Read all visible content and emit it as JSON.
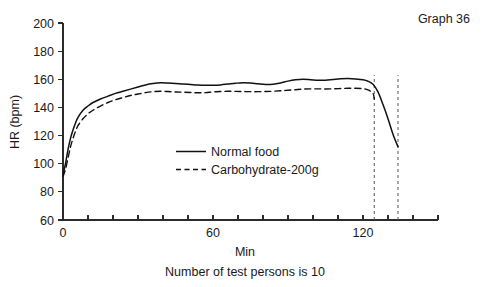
{
  "figure": {
    "graph_id": "Graph 36",
    "caption": "Number of test persons is 10"
  },
  "chart_data": {
    "type": "line",
    "title": "",
    "xlabel": "Min",
    "ylabel": "HR (bpm)",
    "xlim": [
      0,
      150
    ],
    "ylim": [
      60,
      200
    ],
    "yticks": [
      60,
      80,
      100,
      120,
      140,
      160,
      180,
      200
    ],
    "ytick_labels": [
      "60",
      "80",
      "100",
      "120",
      "140",
      "160",
      "180",
      "200"
    ],
    "xticks": [
      0,
      10,
      20,
      30,
      40,
      50,
      60,
      70,
      80,
      90,
      100,
      110,
      120,
      130,
      140,
      150
    ],
    "xtick_labels_shown": {
      "0": "0",
      "60": "60",
      "120": "120"
    },
    "grid": false,
    "legend_position": "center",
    "annotations": [
      {
        "name": "end-marker-carbohydrate",
        "type": "vline",
        "x": 124.5,
        "style": "dashed"
      },
      {
        "name": "end-marker-normal",
        "type": "vline",
        "x": 134.0,
        "style": "dashed"
      }
    ],
    "series": [
      {
        "name": "Normal food",
        "style": "solid",
        "x": [
          0,
          1,
          2,
          3,
          4,
          5,
          6,
          8,
          10,
          12,
          15,
          18,
          21,
          24,
          27,
          30,
          33,
          36,
          39,
          42,
          45,
          48,
          51,
          54,
          57,
          60,
          63,
          66,
          69,
          72,
          75,
          78,
          81,
          84,
          87,
          90,
          93,
          96,
          99,
          102,
          105,
          108,
          111,
          114,
          117,
          120,
          122,
          124,
          126,
          128,
          130,
          132,
          134
        ],
        "values": [
          92,
          100,
          110,
          118,
          124,
          129,
          133,
          138,
          141,
          143.5,
          146,
          148,
          150,
          151.5,
          153,
          154.5,
          156,
          157,
          157.5,
          157.3,
          157,
          156.6,
          156.3,
          156,
          155.8,
          155.7,
          156,
          156.6,
          157.2,
          157.6,
          157.4,
          156.8,
          156.3,
          156.5,
          157.4,
          158.7,
          159.6,
          160,
          159.7,
          159.3,
          159.3,
          159.8,
          160.3,
          160.5,
          160.2,
          159.6,
          158.6,
          156.5,
          151,
          142,
          132,
          121,
          112
        ]
      },
      {
        "name": "Carbohydrate-200g",
        "style": "dashed",
        "x": [
          0,
          1,
          2,
          3,
          4,
          5,
          6,
          8,
          10,
          12,
          15,
          18,
          21,
          24,
          27,
          30,
          33,
          36,
          39,
          42,
          45,
          48,
          51,
          54,
          57,
          60,
          63,
          66,
          69,
          72,
          75,
          78,
          81,
          84,
          87,
          90,
          93,
          96,
          99,
          102,
          105,
          108,
          111,
          114,
          117,
          120,
          122,
          124,
          124.5
        ],
        "values": [
          91,
          96,
          104,
          112,
          118,
          123,
          127,
          132,
          135.5,
          138,
          141,
          143.5,
          145.5,
          147,
          148.5,
          149.5,
          150.5,
          151.2,
          151.5,
          151.3,
          151,
          150.8,
          150.6,
          150.4,
          150.5,
          151,
          151.3,
          151.5,
          151.4,
          151.3,
          151.2,
          151.2,
          151.3,
          151.5,
          151.8,
          152.2,
          152.6,
          153,
          153.2,
          153.2,
          153.1,
          153.2,
          153.4,
          153.6,
          153.6,
          153.3,
          152.5,
          150,
          146
        ]
      }
    ],
    "legend_entries": [
      {
        "label": "Normal food",
        "style": "solid"
      },
      {
        "label": "Carbohydrate-200g",
        "style": "dashed"
      }
    ]
  }
}
